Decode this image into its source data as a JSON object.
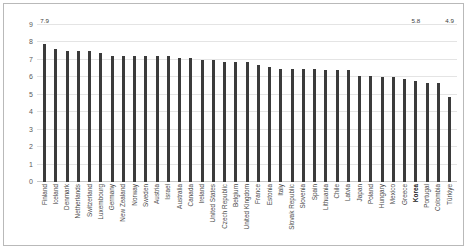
{
  "chart_data": {
    "type": "bar",
    "title": "",
    "subtitle": "",
    "xlabel": "",
    "ylabel": "",
    "ylim": [
      0,
      9
    ],
    "yticks": [
      "0",
      "1",
      "2",
      "3",
      "4",
      "5",
      "6",
      "7",
      "8",
      "9"
    ],
    "grid": true,
    "legend": "none",
    "bar_color": "#3b3b3b",
    "highlight_category": "Korea",
    "categories": [
      "Finland",
      "Iceland",
      "Denmark",
      "Netherlands",
      "Switzerland",
      "Luxembourg",
      "Germany",
      "New Zealand",
      "Norway",
      "Sweden",
      "Austria",
      "Israel",
      "Australia",
      "Canada",
      "Ireland",
      "United States",
      "Czech Republic",
      "Belgium",
      "United Kingdom",
      "France",
      "Estonia",
      "Italy",
      "Slovak Republic",
      "Slovenia",
      "Spain",
      "Lithuania",
      "Chile",
      "Latvia",
      "Japan",
      "Poland",
      "Hungary",
      "Mexico",
      "Greece",
      "Korea",
      "Portugal",
      "Colombia",
      "Türkiye"
    ],
    "values": [
      7.9,
      7.6,
      7.5,
      7.5,
      7.5,
      7.4,
      7.2,
      7.2,
      7.2,
      7.2,
      7.2,
      7.2,
      7.1,
      7.1,
      7.0,
      7.0,
      6.9,
      6.9,
      6.9,
      6.7,
      6.6,
      6.5,
      6.5,
      6.5,
      6.5,
      6.4,
      6.4,
      6.4,
      6.1,
      6.1,
      6.0,
      6.0,
      5.9,
      5.8,
      5.7,
      5.7,
      4.9
    ],
    "point_labels": [
      "7.9",
      "",
      "",
      "",
      "",
      "",
      "",
      "",
      "",
      "",
      "",
      "",
      "",
      "",
      "",
      "",
      "",
      "",
      "",
      "",
      "",
      "",
      "",
      "",
      "",
      "",
      "",
      "",
      "",
      "",
      "",
      "",
      "",
      "5.8",
      "",
      "",
      "4.9"
    ]
  }
}
